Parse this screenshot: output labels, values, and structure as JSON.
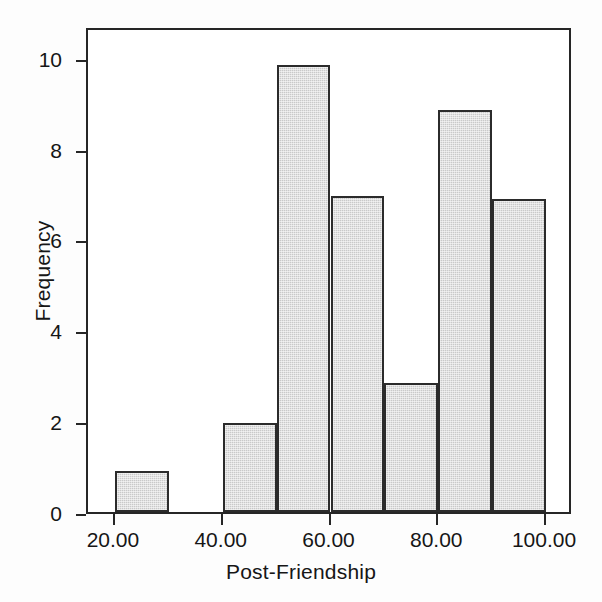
{
  "chart_data": {
    "type": "bar",
    "title": "",
    "subtitle": "",
    "xlabel": "Post-Friendship",
    "ylabel": "Frequency",
    "grid": false,
    "legend": null,
    "bin_width": 10,
    "xlim": [
      15,
      105
    ],
    "ylim": [
      0,
      10.7
    ],
    "xticks": [
      {
        "value": 20,
        "label": "20.00"
      },
      {
        "value": 40,
        "label": "40.00"
      },
      {
        "value": 60,
        "label": "60.00"
      },
      {
        "value": 80,
        "label": "80.00"
      },
      {
        "value": 100,
        "label": "100.00"
      }
    ],
    "yticks": [
      {
        "value": 0,
        "label": "0"
      },
      {
        "value": 2,
        "label": "2"
      },
      {
        "value": 4,
        "label": "4"
      },
      {
        "value": 6,
        "label": "6"
      },
      {
        "value": 8,
        "label": "8"
      },
      {
        "value": 10,
        "label": "10"
      }
    ],
    "bins": [
      {
        "start": 20,
        "end": 30,
        "label": "20-30"
      },
      {
        "start": 30,
        "end": 40,
        "label": "30-40"
      },
      {
        "start": 40,
        "end": 50,
        "label": "40-50"
      },
      {
        "start": 50,
        "end": 60,
        "label": "50-60"
      },
      {
        "start": 60,
        "end": 70,
        "label": "60-70"
      },
      {
        "start": 70,
        "end": 80,
        "label": "70-80"
      },
      {
        "start": 80,
        "end": 90,
        "label": "80-90"
      },
      {
        "start": 90,
        "end": 100,
        "label": "90-100"
      }
    ],
    "categories": [
      "20-30",
      "30-40",
      "40-50",
      "50-60",
      "60-70",
      "70-80",
      "80-90",
      "90-100"
    ],
    "values": [
      0.9,
      0,
      1.95,
      9.85,
      6.95,
      2.85,
      8.85,
      6.9
    ]
  },
  "style": {
    "bar_fill": "#c9c9c9",
    "bar_edge": "#2b2b2b",
    "axis_color": "#262626",
    "text_color": "#161616",
    "background": "#ffffff"
  }
}
